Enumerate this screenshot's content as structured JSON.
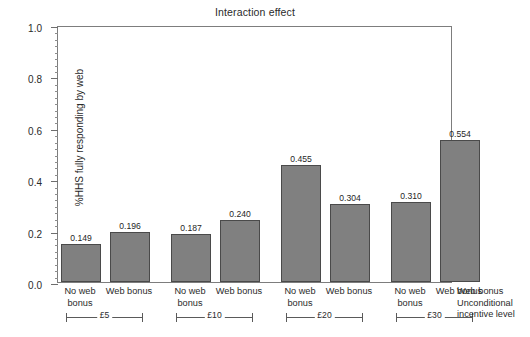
{
  "chart_data": {
    "type": "bar",
    "title": "Interaction effect",
    "xlabel": "Unconditional incentive level",
    "ylabel": "%HHS fully responding by web",
    "ylim": [
      0.0,
      1.0
    ],
    "ytick_labels": [
      "0.0",
      "0.2",
      "0.4",
      "0.6",
      "0.8",
      "1.0"
    ],
    "ytick_values": [
      0.0,
      0.2,
      0.4,
      0.6,
      0.8,
      1.0
    ],
    "ytick_step": 0.2,
    "yminor_step": 0.025,
    "grid": false,
    "legend": "none",
    "bar_color": "#808080",
    "bar_edge_color": "#4a4a4a",
    "categories": [
      "No web bonus",
      "Web bonus",
      "No web bonus",
      "Web bonus",
      "No web bonus",
      "Web bonus",
      "No web bonus",
      "Web bonus"
    ],
    "values": [
      0.149,
      0.196,
      0.187,
      0.24,
      0.455,
      0.304,
      0.31,
      0.554
    ],
    "value_labels": [
      "0.149",
      "0.196",
      "0.187",
      "0.240",
      "0.455",
      "0.304",
      "0.310",
      "0.554"
    ],
    "groups": [
      {
        "label": "£5",
        "bars": [
          0,
          1
        ]
      },
      {
        "label": "£10",
        "bars": [
          2,
          3
        ]
      },
      {
        "label": "£20",
        "bars": [
          4,
          5
        ]
      },
      {
        "label": "£30",
        "bars": [
          6,
          7
        ]
      }
    ]
  },
  "axis_key": {
    "line1": "Web bonus",
    "line2": "Unconditional",
    "line3": "incentive level"
  }
}
